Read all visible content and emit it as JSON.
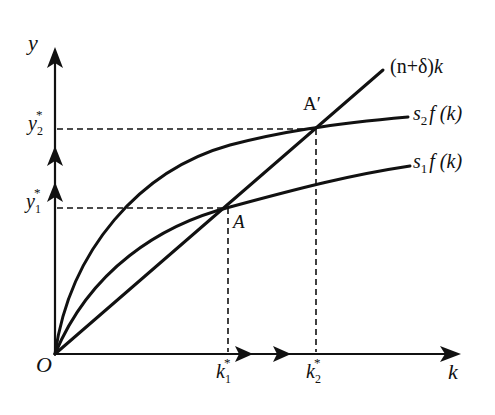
{
  "diagram": {
    "axes": {
      "y_label": "y",
      "x_label": "k",
      "origin_label": "O"
    },
    "curves": [
      {
        "id": "depreciation-line",
        "label_main": "(n+δ)",
        "label_var": "k"
      },
      {
        "id": "s2-curve",
        "label_s": "s",
        "label_sub": "2",
        "label_f": "f (k)"
      },
      {
        "id": "s1-curve",
        "label_s": "s",
        "label_sub": "1",
        "label_f": "f (k)"
      }
    ],
    "points": {
      "A": "A",
      "A_prime": "A′"
    },
    "y_ticks": [
      {
        "base": "y",
        "sub": "1",
        "sup": "*"
      },
      {
        "base": "y",
        "sub": "2",
        "sup": "*"
      }
    ],
    "x_ticks": [
      {
        "base": "k",
        "sub": "1",
        "sup": "*"
      },
      {
        "base": "k",
        "sub": "2",
        "sup": "*"
      }
    ],
    "colors": {
      "line": "#111111",
      "background": "#ffffff"
    }
  }
}
